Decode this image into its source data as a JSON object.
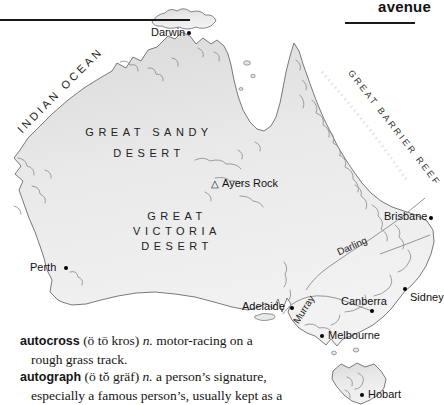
{
  "page": {
    "guide_word": "avenue"
  },
  "map": {
    "ocean_label": "INDIAN OCEAN",
    "reef_label": "GREAT BARRIER REEF",
    "desert_sandy_line1": "GREAT SANDY",
    "desert_sandy_line2": "DESERT",
    "desert_victoria_line1": "GREAT",
    "desert_victoria_line2": "VICTORIA",
    "desert_victoria_line3": "DESERT",
    "ayers_rock_marker": "△",
    "ayers_rock_label": "Ayers Rock",
    "river_darling": "Darling",
    "river_murray": "Murray",
    "city_darwin": "Darwin",
    "city_perth": "Perth",
    "city_adelaide": "Adelaide",
    "city_brisbane": "Brisbane",
    "city_sydney": "Sidney",
    "city_canberra": "Canberra",
    "city_melbourne": "Melbourne",
    "city_hobart": "Hobart"
  },
  "dictionary": {
    "entries": [
      {
        "headword": "autocross",
        "pronunciation": "(ö tō kros)",
        "pos": "n.",
        "def_line1": "motor-racing on a",
        "def_line2": "rough grass track."
      },
      {
        "headword": "autograph",
        "pronunciation": "(ö tŏ gräf)",
        "pos": "n.",
        "def_line1": "a person’s signature,",
        "def_line2": "especially a famous person’s, usually kept as a"
      }
    ]
  }
}
